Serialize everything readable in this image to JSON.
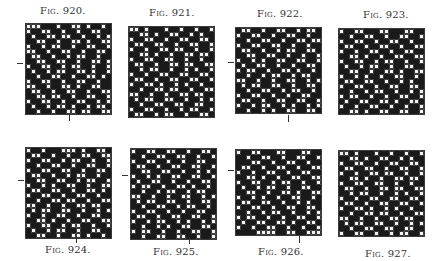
{
  "cell_size": 5,
  "figures": [
    {
      "id": "fig920",
      "label": "Fig. 920.",
      "label_pos": [
        40,
        5
      ],
      "label_below": false,
      "grid": {
        "x": 25,
        "y": 23,
        "cols": 17,
        "rows": 18
      },
      "tick_left": {
        "x": 17,
        "y": 63
      },
      "tick_bottom": {
        "x": 69,
        "y": 114
      }
    },
    {
      "id": "fig921",
      "label": "Fig. 921.",
      "label_pos": [
        149,
        7
      ],
      "label_below": false,
      "grid": {
        "x": 128,
        "y": 26,
        "cols": 17,
        "rows": 18
      },
      "tick_left": null,
      "tick_bottom": null
    },
    {
      "id": "fig922",
      "label": "Fig. 922.",
      "label_pos": [
        257,
        8
      ],
      "label_below": false,
      "grid": {
        "x": 235,
        "y": 27,
        "cols": 17,
        "rows": 17
      },
      "tick_left": {
        "x": 228,
        "y": 62
      },
      "tick_bottom": {
        "x": 288,
        "y": 115
      }
    },
    {
      "id": "fig923",
      "label": "Fig. 923.",
      "label_pos": [
        363,
        9
      ],
      "label_below": false,
      "grid": {
        "x": 338,
        "y": 28,
        "cols": 17,
        "rows": 17
      },
      "tick_left": null,
      "tick_bottom": null
    },
    {
      "id": "fig924",
      "label": "Fig. 924.",
      "label_pos": [
        45,
        244
      ],
      "label_below": true,
      "grid": {
        "x": 25,
        "y": 147,
        "cols": 17,
        "rows": 18
      },
      "tick_left": {
        "x": 18,
        "y": 180
      },
      "tick_bottom": {
        "x": 76,
        "y": 236
      }
    },
    {
      "id": "fig925",
      "label": "Fig. 925.",
      "label_pos": [
        153,
        246
      ],
      "label_below": true,
      "grid": {
        "x": 130,
        "y": 148,
        "cols": 17,
        "rows": 18
      },
      "tick_left": {
        "x": 122,
        "y": 175
      },
      "tick_bottom": {
        "x": 189,
        "y": 237
      }
    },
    {
      "id": "fig926",
      "label": "Fig. 926.",
      "label_pos": [
        258,
        246
      ],
      "label_below": true,
      "grid": {
        "x": 235,
        "y": 149,
        "cols": 17,
        "rows": 17
      },
      "tick_left": {
        "x": 228,
        "y": 170
      },
      "tick_bottom": {
        "x": 299,
        "y": 236
      }
    },
    {
      "id": "fig927",
      "label": "Fig. 927.",
      "label_pos": [
        365,
        248
      ],
      "label_below": true,
      "grid": {
        "x": 338,
        "y": 150,
        "cols": 17,
        "rows": 17
      },
      "tick_left": null,
      "tick_bottom": null
    }
  ],
  "patterns": {
    "fig920": [
      "OOOXXXOXXOOXOXXOX",
      "OXXOOXXOXXOXXOOXX",
      "XOXXOOXOOXXOXXOXO",
      "XXOOXXOXXOOXOXXOO",
      "OXXOXOOXXOXXOOXXO",
      "OOXXOXXOOXXOXXOOX",
      "XOOXXOXXOXOOXXOXX",
      "XXOOXXOOXXOXXOOXO",
      "OXXOOXXOXOOXXOXXO",
      "XOXXOXOOXXOOXOXXO",
      "XXOXXOOXXOXXOOXOX",
      "OXXOOXXOXXOOXXOXX",
      "OOXXOXXOOXOXXOOXX",
      "XOOXXOXXOOXXOXXOO",
      "XXOOXOOXXOXXOOXXO",
      "OXXOOXXOXXOOXXOXO",
      "XOXXOXOOXOXXOXOOX",
      "XXOXXOXXOOXOOXXOO"
    ],
    "fig921": [
      "OOXOXXXOXXOXXOXXO",
      "XXOOXOXXOOXXOXOXX",
      "OXXOOXXOXXOOXXOOX",
      "XOOXXOOXXOXXOOXXO",
      "OXXOXXOOXOOXXOXXO",
      "XXOOXOXXOXXOOXOOX",
      "OXXOOXXOOXXOXXOXX",
      "XOOXXOXXOOXOOXXOO",
      "XXOXOOXXOXXOXOXXO",
      "OXXOXXOOXXOOXXOOX",
      "XOOXXOXXOOXXOOXXO",
      "OXXOOXOXXOXOXXOXX",
      "XXOXXOOXOOXXOXXOO",
      "OOXXOXXOXXOOXOOXX",
      "XOXOOXXOOXXOXXOXO",
      "XXOXXOOXXOOXXOOXX",
      "OXXOOXXOXXOXOOXXO",
      "XOOXXOXOOXXOXXOOX"
    ],
    "fig922": [
      "XOOXXOXXOOXXOXOOX",
      "OXXOOXXOXXOOXXOXX",
      "XXOXXOOXXOXXOOXOO",
      "OXXOOXXOOXXOXXOXX",
      "XOOXXOXXOXOOXXOOX",
      "XXOOXXOOXXOXXOXXO",
      "OXXOXOXXOOXXOOXXO",
      "XOXXOOXXOXXOXXOOX",
      "OXOOXXOXXOOXOXXOX",
      "XXOXXOXOOXXOXOOXX",
      "OOXXOXXOXXOOXXOXO",
      "XOXOOXXOOXXOXXOOX",
      "XXOXXOOXXOXOOXXOX",
      "OXXOOXXOXXOXXOOXX",
      "XOOXXOXXOOXXOOXXO",
      "OXXOXOOXXOXOXXOXO",
      "XXOXXOXOXXOOXXOOX"
    ],
    "fig923": [
      "OXXOOXXXOOXXXOOXX",
      "XXOXXOOXXOXXOOXXO",
      "OXXOOXXOXXOOXXOXX",
      "XOOXXOXXOOXXOXXOO",
      "OXXOXXOOXXOXXOOXX",
      "XXOOXOXXOXXOOXXOO",
      "OXXOOXXOXOOXXOXXO",
      "XOXXOXOOXXOXXOOXX",
      "XXOOXXOXXOOXOXXOO",
      "OXXOXOXXOXXOOXXOX",
      "XOOXXOOXXOXXOXOXX",
      "OXXOOXXOXXOOXXOOX",
      "XXOXXOXOOXXOXXOXO",
      "OXOOXXOXXOXXOOXXO",
      "XOXXOOXXOOXOXXOOX",
      "OXXOXXOOXXOXXOXXO",
      "XXOOXOXXOOXXOOXXO"
    ],
    "fig924": [
      "OXXOXXXOOOXOXXOOX",
      "XOOXXOXXOXXOOXXOO",
      "OXXOOXXOXOOXXOXXO",
      "XXOXXOOXXOXXOOXXO",
      "OXXOOXXOOXXOXXOOX",
      "XOOXXOXXOXOOXXOXX",
      "XXOOXXOOXXOXOOXXO",
      "OXXOXOXXOOXXOXXOO",
      "XOOXXOOXXOXXOOXOX",
      "OXXOOXXOXXOOXXOXX",
      "XXOXXOOXOOXXOXXOO",
      "OOXXOXXOXXOOXOOXX",
      "XOXOOXXOOXXOXXOXO",
      "OXXOXXOOXXOXXOOXX",
      "XXOOXOXXOXXOOXXOO",
      "OXXOOXXOXOOXXOXXO",
      "XOXXOXOOXXOXXOOXX",
      "XXOOXXOXXOOXOXXOX"
    ],
    "fig925": [
      "OXXOOXXOOXXOXXOOX",
      "XXOXXOOXXOOXXOXXO",
      "OXXOOXXOXXOXXOOXX",
      "XOOXXOXXOOXXOOXXO",
      "XXOOXXOOXXOXXOXOX",
      "OXXOXOXXOOXXOOXXO",
      "XOXXOOXXOXXOXXOOX",
      "OXOOXXOXXOOXOXXOX",
      "XXOXXOXOOXXOXOOXX",
      "OOXXOXXOXXOOXXOXO",
      "XOXOOXXOOXXOXXOOX",
      "XXOXXOOXXOXOOXXOX",
      "OXXOOXXOXXOXXOOXX",
      "XOOXXOXXOOXXOOXXO",
      "OXXOXOOXXOXOXXOXO",
      "XXOXXOXOXXOOXXOOX",
      "OXOOXXOXXOXXOOXXO",
      "XXOXXOOXXOOXXOXXO"
    ],
    "fig926": [
      "OXXOOXXXOOXXXOOXX",
      "XXOXXOOXXOXXOOXXO",
      "XXXOOXXOXXOOXXOXX",
      "XOOXXOXXOOXXOXXOO",
      "OXXOXXOOXXOXXOOXX",
      "XXOOXOXXOXXOOXXOO",
      "OXXOOXXOXOOXXOXXO",
      "XOXXOXOOXXOXXOOXX",
      "XXOOXXOXXOOXOXXOO",
      "OXXOXOXXOXXOOXXOX",
      "XOOXXOOXXOXXOXOXX",
      "OXXOOXXOXXOOXXOOX",
      "XXOXXOXOOXXOXXOXO",
      "OXOOXXOXXOXXOOXXO",
      "XOXXOOXXOOXOXXOOX",
      "OXXOXXOOXXOXXOXXO",
      "XXXXOOOOXXOOXXOOO"
    ],
    "fig927": [
      "OOXOXXXOXXOXXOXXO",
      "XXOOXOXXOOXXOXOXX",
      "OXXOOXXOXXOOXXOOX",
      "XOOXXOOXXOXXOOXXO",
      "OXXOXXOOXOOXXOXXO",
      "XXOOXOXXOXXOOXOOX",
      "OXXOOXXOOXXOXXOXX",
      "XOOXXOXXOOXOOXXOO",
      "XXOXOOXXOXXOXOXXO",
      "OXXOXXOOXXOOXXOOX",
      "XOOXXOXXOOXXOOXXO",
      "OXXOOXOXXOXOXXOXX",
      "XXOXXOOXOOXXOXXOO",
      "OOXXOXXOXXOOXOOXX",
      "XOXOOXXOOXXOXXOXO",
      "XXOXXOOXXOOXXOOXX",
      "OXXOOXXOXXOXOOXXO"
    ]
  }
}
